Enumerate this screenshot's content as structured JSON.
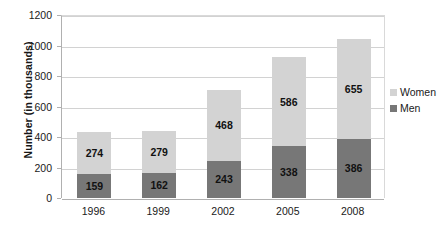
{
  "chart_data": {
    "type": "bar",
    "subtype": "stacked-vertical",
    "title": "",
    "xlabel": "",
    "ylabel": "Number (in thousands)",
    "categories": [
      "1996",
      "1999",
      "2002",
      "2005",
      "2008"
    ],
    "series": [
      {
        "name": "Men",
        "color": "#777777",
        "values": [
          159,
          162,
          243,
          338,
          386
        ]
      },
      {
        "name": "Women",
        "color": "#d3d3d3",
        "values": [
          274,
          279,
          468,
          586,
          655
        ]
      }
    ],
    "stack_totals": [
      433,
      441,
      711,
      924,
      1041
    ],
    "ylim": [
      0,
      1200
    ],
    "yticks": [
      0,
      200,
      400,
      600,
      800,
      1000,
      1200
    ],
    "ytick_labels": [
      "0",
      "200",
      "400",
      "600",
      "800",
      "1000",
      "1200"
    ],
    "grid": true,
    "grid_axis": "y",
    "legend_position": "right",
    "legend_entries": [
      "Women",
      "Men"
    ],
    "data_labels": true,
    "plot_background": "#ffffff"
  }
}
